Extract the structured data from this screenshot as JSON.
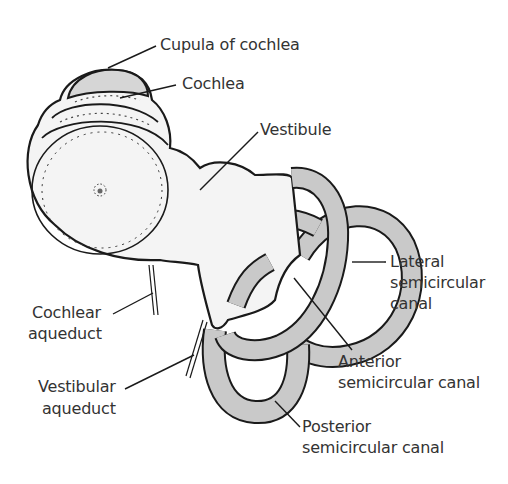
{
  "diagram": {
    "colors": {
      "outline": "#1a1a1a",
      "body_fill": "#f4f4f4",
      "canal_fill": "#c9c9c9",
      "cupula_fill": "#d6d6d6",
      "text": "#333333",
      "background": "#ffffff"
    },
    "labels": {
      "cupula": "Cupula of cochlea",
      "cochlea": "Cochlea",
      "vestibule": "Vestibule",
      "lateral_l1": "Lateral",
      "lateral_l2": "semicircular",
      "lateral_l3": "canal",
      "cochlear_aq_l1": "Cochlear",
      "cochlear_aq_l2": "aqueduct",
      "anterior_l1": "Anterior",
      "anterior_l2": "semicircular canal",
      "vestibular_aq_l1": "Vestibular",
      "vestibular_aq_l2": "aqueduct",
      "posterior_l1": "Posterior",
      "posterior_l2": "semicircular canal"
    }
  }
}
